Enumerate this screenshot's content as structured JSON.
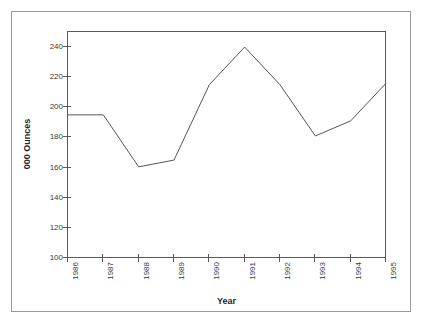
{
  "chart_data": {
    "type": "line",
    "title": "",
    "subtitle": "",
    "xlabel": "Year",
    "ylabel": "000 Ounces",
    "categories": [
      "1986",
      "1987",
      "1988",
      "1989",
      "1990",
      "1991",
      "1992",
      "1993",
      "1994",
      "1995"
    ],
    "x": [
      1986,
      1987,
      1988,
      1989,
      1990,
      1991,
      1992,
      1993,
      1994,
      1995
    ],
    "values": [
      195,
      195,
      160.5,
      165,
      215,
      240,
      215,
      181,
      191,
      216
    ],
    "series": [
      {
        "name": "",
        "values": [
          195,
          195,
          160.5,
          165,
          215,
          240,
          215,
          181,
          191,
          216
        ]
      }
    ],
    "ylim": [
      100,
      250
    ],
    "xlim": [
      1986,
      1995
    ],
    "yticks": [
      100,
      120,
      140,
      160,
      180,
      200,
      220,
      240
    ],
    "ytick_labels": [
      "100",
      "120",
      "140",
      "160",
      "180",
      "200",
      "220",
      "240"
    ],
    "xticks": [
      1986,
      1987,
      1988,
      1989,
      1990,
      1991,
      1992,
      1993,
      1994,
      1995
    ],
    "xtick_labels": [
      "1986",
      "1987",
      "1988",
      "1989",
      "1990",
      "1991",
      "1992",
      "1993",
      "1994",
      "1995"
    ],
    "grid": false,
    "legend": false,
    "legend_position": "none",
    "line_color": "#555555",
    "line_width": 1,
    "axis_color": "#5a5a5a",
    "frame_color": "#9a9a9a",
    "background_color": "#ffffff",
    "markers": false,
    "annotations": []
  }
}
